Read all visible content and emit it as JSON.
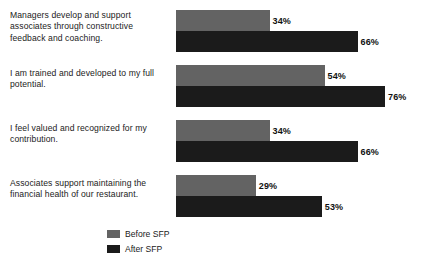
{
  "chart_data": {
    "type": "bar",
    "orientation": "horizontal",
    "title": "",
    "subtitle": "",
    "xlabel": "",
    "ylabel": "",
    "xlim": [
      0,
      100
    ],
    "grid": false,
    "legend_position": "bottom-left",
    "value_suffix": "%",
    "categories": [
      "Managers develop and support associates through constructive feedback and coaching.",
      "I am trained and developed to my full potential.",
      "I feel valued and recognized for my contribution.",
      "Associates support maintaining the financial health of our restaurant."
    ],
    "series": [
      {
        "name": "Before SFP",
        "color": "#636363",
        "values": [
          34,
          54,
          34,
          29
        ],
        "value_labels": [
          "34%",
          "54%",
          "34%",
          "29%"
        ]
      },
      {
        "name": "After SFP",
        "color": "#1b1b1b",
        "values": [
          66,
          76,
          66,
          53
        ],
        "value_labels": [
          "66%",
          "76%",
          "66%",
          "53%"
        ]
      }
    ]
  },
  "legend": {
    "items": [
      {
        "label": "Before SFP",
        "color": "#636363"
      },
      {
        "label": "After SFP",
        "color": "#1b1b1b"
      }
    ]
  }
}
